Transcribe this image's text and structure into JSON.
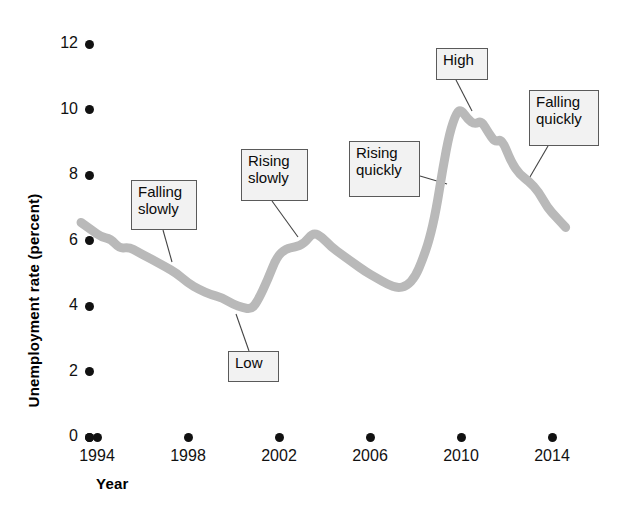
{
  "chart_data": {
    "type": "line",
    "title": "",
    "xlabel": "Year",
    "ylabel": "Unemployment rate (percent)",
    "xlim": [
      1993.2,
      2014.9
    ],
    "ylim": [
      0,
      12
    ],
    "grid": false,
    "legend": "none",
    "line_color": "#b9b9b9",
    "series": [
      {
        "name": "Unemployment rate",
        "x": [
          1993.3,
          1993.8,
          1994.2,
          1994.6,
          1995.0,
          1995.4,
          1995.8,
          1996.2,
          1996.6,
          1997.0,
          1997.5,
          1998.0,
          1998.5,
          1999.0,
          1999.5,
          2000.0,
          2000.4,
          2000.8,
          2001.1,
          2001.5,
          2001.9,
          2002.3,
          2002.7,
          2003.1,
          2003.5,
          2003.9,
          2004.3,
          2004.8,
          2005.3,
          2005.8,
          2006.3,
          2006.8,
          2007.2,
          2007.6,
          2008.0,
          2008.3,
          2008.6,
          2008.9,
          2009.2,
          2009.5,
          2009.8,
          2010.0,
          2010.3,
          2010.6,
          2010.9,
          2011.2,
          2011.5,
          2011.8,
          2012.2,
          2012.6,
          2013.0,
          2013.4,
          2013.8,
          2014.2,
          2014.6
        ],
        "y": [
          6.55,
          6.3,
          6.1,
          6.05,
          5.75,
          5.8,
          5.65,
          5.5,
          5.35,
          5.2,
          5.0,
          4.7,
          4.5,
          4.35,
          4.25,
          4.05,
          3.95,
          3.9,
          4.2,
          4.8,
          5.5,
          5.75,
          5.8,
          5.9,
          6.25,
          6.1,
          5.8,
          5.55,
          5.3,
          5.05,
          4.85,
          4.65,
          4.55,
          4.6,
          4.9,
          5.4,
          6.0,
          6.9,
          8.2,
          9.3,
          9.9,
          10.0,
          9.7,
          9.55,
          9.65,
          9.3,
          9.0,
          9.1,
          8.4,
          8.0,
          7.8,
          7.5,
          7.0,
          6.7,
          6.4
        ],
        "color": "#b9b9b9"
      }
    ],
    "y_ticks": [
      0,
      2,
      4,
      6,
      8,
      10,
      12
    ],
    "y_tick_labels": [
      "0",
      "2",
      "4",
      "6",
      "8",
      "10",
      "12"
    ],
    "x_ticks": [
      1994,
      1998,
      2002,
      2006,
      2010,
      2014
    ],
    "x_tick_labels": [
      "1994",
      "1998",
      "2002",
      "2006",
      "2010",
      "2014"
    ],
    "annotations": [
      {
        "label": "Falling\nslowly",
        "box_x": 131,
        "box_y": 180,
        "box_w": 66,
        "box_h": 50,
        "leader_x1": 163,
        "leader_y1": 230,
        "leader_x2": 172,
        "leader_y2": 262
      },
      {
        "label": "Low",
        "box_x": 228,
        "box_y": 351,
        "box_w": 51,
        "box_h": 31,
        "leader_x1": 249,
        "leader_y1": 351,
        "leader_x2": 236,
        "leader_y2": 314
      },
      {
        "label": "Rising\nslowly",
        "box_x": 241,
        "box_y": 149,
        "box_w": 67,
        "box_h": 52,
        "leader_x1": 272,
        "leader_y1": 201,
        "leader_x2": 298,
        "leader_y2": 237
      },
      {
        "label": "Rising\nquickly",
        "box_x": 349,
        "box_y": 141,
        "box_w": 71,
        "box_h": 56,
        "leader_x1": 420,
        "leader_y1": 176,
        "leader_x2": 447,
        "leader_y2": 184
      },
      {
        "label": "High",
        "box_x": 436,
        "box_y": 48,
        "box_w": 52,
        "box_h": 32,
        "leader_x1": 456,
        "leader_y1": 80,
        "leader_x2": 472,
        "leader_y2": 111
      },
      {
        "label": "Falling\nquickly",
        "box_x": 529,
        "box_y": 90,
        "box_w": 70,
        "box_h": 56,
        "leader_x1": 548,
        "leader_y1": 146,
        "leader_x2": 527,
        "leader_y2": 182
      }
    ]
  },
  "axes": {
    "y_title": "Unemployment rate (percent)",
    "x_title": "Year"
  },
  "plot_geometry": {
    "x_of_1994": 97,
    "x_of_2014": 552,
    "y_of_0": 437,
    "y_of_12": 44
  }
}
